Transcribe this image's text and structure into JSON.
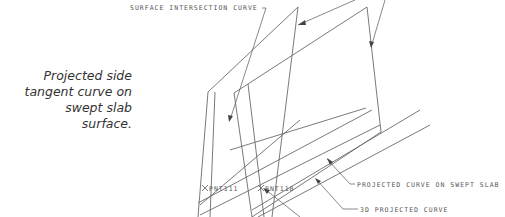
{
  "caption": {
    "lines": [
      "Projected side",
      "tangent curve on",
      "swept slab",
      "surface."
    ]
  },
  "labels": {
    "surface_intersection_curve": "SURFACE INTERSECTION CURVE",
    "projected_curve_on_swept_slab": "PROJECTED CURVE ON SWEPT SLAB",
    "projected_3d_curve": "3D PROJECTED CURVE",
    "point_a": "PNT111",
    "point_b": "PNT110"
  },
  "colors": {
    "line": "#6a6a6a",
    "text": "#555555",
    "caption": "#333333"
  }
}
